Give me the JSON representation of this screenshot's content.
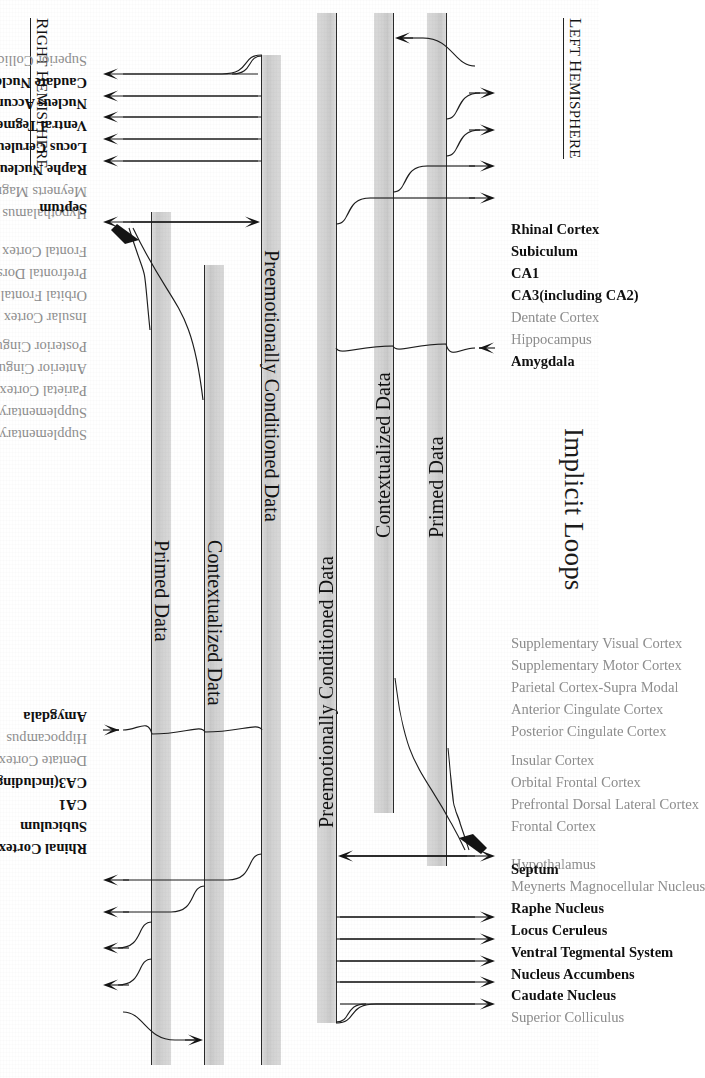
{
  "figure": {
    "title": "Implicit Loops",
    "hemispheres": {
      "left": {
        "prefix": "L",
        "rest": "EFT ",
        "prefix2": "H",
        "rest2": "EMISPHERE",
        "full": "Left Hemisphere"
      },
      "right": {
        "prefix": "R",
        "rest": "IGHT ",
        "prefix2": "H",
        "rest2": "EMISPHERE",
        "full": "Right Hemisphere"
      }
    },
    "bands": [
      {
        "id": "preemotional",
        "label": "Preemotionally Conditioned Data"
      },
      {
        "id": "contextualized",
        "label": "Contextualized Data"
      },
      {
        "id": "primed",
        "label": "Primed Data"
      }
    ],
    "groups": [
      {
        "id": "subcortical",
        "labels": [
          {
            "text": "Superior Colliculus",
            "bold": false,
            "arrow": false
          },
          {
            "text": "Caudate Nucleus",
            "bold": true,
            "arrow": true,
            "dir": "out"
          },
          {
            "text": "Nucleus Accumbens",
            "bold": true,
            "arrow": true,
            "dir": "out"
          },
          {
            "text": "Ventral Tegmental System",
            "bold": true,
            "arrow": true,
            "dir": "out"
          },
          {
            "text": "Locus Ceruleus",
            "bold": true,
            "arrow": true,
            "dir": "out"
          },
          {
            "text": "Raphe Nucleus",
            "bold": true,
            "arrow": true,
            "dir": "out"
          },
          {
            "text": "Meynerts Magnocellular Nucleus",
            "bold": false,
            "arrow": false
          },
          {
            "text": "Hypothalamus",
            "bold": false,
            "arrow": false
          },
          {
            "text": "Septum",
            "bold": true,
            "arrow": true,
            "dir": "bidir"
          }
        ]
      },
      {
        "id": "cortical",
        "labels": [
          {
            "text": "Frontal Cortex",
            "bold": false,
            "arrow": false
          },
          {
            "text": "Prefrontal Dorsal Lateral Cortex",
            "bold": false,
            "arrow": false
          },
          {
            "text": "Orbital Frontal Cortex",
            "bold": false,
            "arrow": false
          },
          {
            "text": "Insular Cortex",
            "bold": false,
            "arrow": false
          },
          {
            "text": "Posterior Cingulate Cortex",
            "bold": false,
            "arrow": false
          },
          {
            "text": "Anterior Cingulate Cortex",
            "bold": false,
            "arrow": false
          },
          {
            "text": "Parietal Cortex-Supra Modal",
            "bold": false,
            "arrow": false
          },
          {
            "text": "Supplementary Motor Cortex",
            "bold": false,
            "arrow": false
          },
          {
            "text": "Supplementary Visual Cortex",
            "bold": false,
            "arrow": false
          }
        ]
      },
      {
        "id": "limbic",
        "labels": [
          {
            "text": "Amygdala",
            "bold": true,
            "arrow": true,
            "dir": "in"
          },
          {
            "text": "Hippocampus",
            "bold": false,
            "arrow": false
          },
          {
            "text": "Dentate Cortex",
            "bold": false,
            "arrow": false
          },
          {
            "text": "CA3(including CA2)",
            "bold": true,
            "arrow": true,
            "dir": "out"
          },
          {
            "text": "CA1",
            "bold": true,
            "arrow": true,
            "dir": "out"
          },
          {
            "text": "Subiculum",
            "bold": true,
            "arrow": true,
            "dir": "out"
          },
          {
            "text": "Rhinal Cortex",
            "bold": true,
            "arrow": true,
            "dir": "out"
          }
        ]
      }
    ],
    "colors": {
      "band_fill": "#d4d4d4",
      "ink": "#1a1a1a",
      "faded_label": "#8e8e8e",
      "bold_label": "#101010",
      "background": "#ffffff"
    }
  }
}
